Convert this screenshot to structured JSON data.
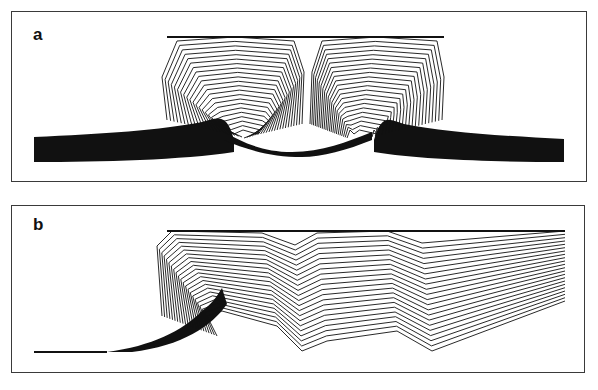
{
  "figure": {
    "panels": [
      {
        "id": "a",
        "label": "a",
        "description": "Two adjacent dome-shaped layered structures formed of nested contour lines rising above a thick dark basal layer that thins and bends upward beneath each dome; a narrow cusp separates the two domes at the top centre.",
        "line_color": "#111111",
        "contour_line_count": 22
      },
      {
        "id": "b",
        "label": "b",
        "description": "Single asymmetric layered body of contour lines: a steep left flank rising from a thin basal line, a central V-shaped cusp, and stacked nearly horizontal layers extending to the right edge.",
        "line_color": "#111111",
        "contour_line_count": 22
      }
    ],
    "background_color": "#ffffff",
    "frame_color": "#3a3a3a"
  }
}
